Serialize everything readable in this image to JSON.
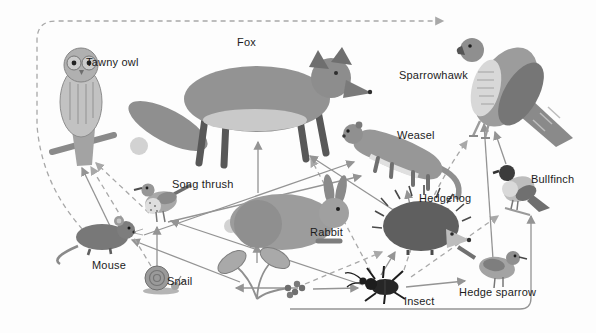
{
  "figure": {
    "type": "food-web-diagram",
    "background_color": "#fdfdfd",
    "line_style_colors": {
      "solid": "#949494",
      "dashed": "#a8a8a8"
    },
    "organisms": [
      {
        "id": "tawny-owl",
        "label": "Tawny owl"
      },
      {
        "id": "fox",
        "label": "Fox"
      },
      {
        "id": "sparrowhawk",
        "label": "Sparrowhawk"
      },
      {
        "id": "weasel",
        "label": "Weasel"
      },
      {
        "id": "song-thrush",
        "label": "Song thrush"
      },
      {
        "id": "rabbit",
        "label": "Rabbit"
      },
      {
        "id": "hedgehog",
        "label": "Hedgehog"
      },
      {
        "id": "bullfinch",
        "label": "Bullfinch"
      },
      {
        "id": "mouse",
        "label": "Mouse"
      },
      {
        "id": "snail",
        "label": "Snail"
      },
      {
        "id": "plant",
        "label": null
      },
      {
        "id": "insect",
        "label": "Insect"
      },
      {
        "id": "hedge-sparrow",
        "label": "Hedge sparrow"
      }
    ],
    "relations": [
      {
        "from": "plant",
        "to": "snail",
        "style": "solid"
      },
      {
        "from": "plant",
        "to": "rabbit",
        "style": "solid"
      },
      {
        "from": "plant",
        "to": "insect",
        "style": "solid"
      },
      {
        "from": "plant",
        "to": "mouse",
        "style": "solid"
      },
      {
        "from": "plant",
        "to": "bullfinch",
        "style": "solid"
      },
      {
        "from": "plant",
        "to": "hedgehog",
        "style": "dashed"
      },
      {
        "from": "snail",
        "to": "song-thrush",
        "style": "solid"
      },
      {
        "from": "snail",
        "to": "tawny-owl",
        "style": "dashed"
      },
      {
        "from": "insect",
        "to": "song-thrush",
        "style": "solid"
      },
      {
        "from": "insect",
        "to": "hedgehog",
        "style": "solid"
      },
      {
        "from": "insect",
        "to": "hedge-sparrow",
        "style": "solid"
      },
      {
        "from": "insect",
        "to": "fox",
        "style": "dashed"
      },
      {
        "from": "insect",
        "to": "sparrowhawk",
        "style": "dashed"
      },
      {
        "from": "insect",
        "to": "bullfinch",
        "style": "dashed"
      },
      {
        "from": "mouse",
        "to": "tawny-owl",
        "style": "solid"
      },
      {
        "from": "mouse",
        "to": "weasel",
        "style": "solid"
      },
      {
        "from": "mouse",
        "to": "sparrowhawk",
        "style": "dashed"
      },
      {
        "from": "song-thrush",
        "to": "tawny-owl",
        "style": "dashed"
      },
      {
        "from": "song-thrush",
        "to": "weasel",
        "style": "solid"
      },
      {
        "from": "rabbit",
        "to": "fox",
        "style": "solid"
      },
      {
        "from": "hedgehog",
        "to": "fox",
        "style": "solid"
      },
      {
        "from": "hedgehog",
        "to": "weasel",
        "style": "solid"
      },
      {
        "from": "hedge-sparrow",
        "to": "sparrowhawk",
        "style": "solid"
      },
      {
        "from": "bullfinch",
        "to": "sparrowhawk",
        "style": "solid"
      }
    ]
  }
}
